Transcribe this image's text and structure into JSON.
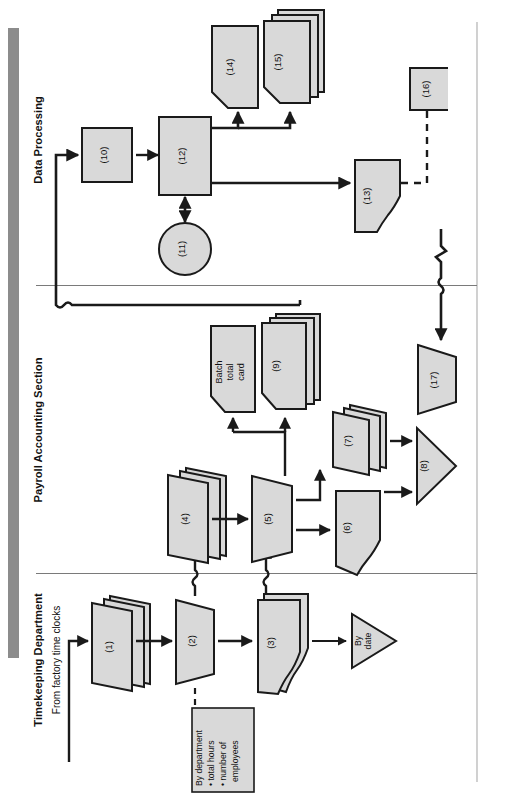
{
  "figure": {
    "orientation": "rotated-90-ccw",
    "type": "system-flowchart",
    "swimlanes": [
      {
        "id": "timekeeping",
        "label": "Timekeeping Department"
      },
      {
        "id": "payroll",
        "label": "Payroll Accounting Section"
      },
      {
        "id": "dataproc",
        "label": "Data Processing"
      }
    ],
    "entry_note": "From factory time clocks",
    "annotations": [
      {
        "id": "ann-batch",
        "text": "By department\n•  total hours\n•  number of\n    employees"
      }
    ],
    "file_labels": [
      {
        "id": "file-bydate",
        "text": "By\ndate"
      }
    ],
    "named_nodes": [
      {
        "id": "batch-total-card",
        "text": "Batch\ntotal\ncard"
      }
    ],
    "nodes": [
      {
        "id": "n1",
        "label": "(1)",
        "shape": "card-stack",
        "lane": "timekeeping"
      },
      {
        "id": "n2",
        "label": "(2)",
        "shape": "manual-operation",
        "lane": "timekeeping"
      },
      {
        "id": "n3",
        "label": "(3)",
        "shape": "document-stack",
        "lane": "timekeeping"
      },
      {
        "id": "n4",
        "label": "(4)",
        "shape": "card-stack",
        "lane": "payroll"
      },
      {
        "id": "n5",
        "label": "(5)",
        "shape": "manual-operation",
        "lane": "payroll"
      },
      {
        "id": "n6",
        "label": "(6)",
        "shape": "document",
        "lane": "payroll"
      },
      {
        "id": "n7",
        "label": "(7)",
        "shape": "card-stack",
        "lane": "payroll"
      },
      {
        "id": "n8",
        "label": "(8)",
        "shape": "file-triangle",
        "lane": "payroll"
      },
      {
        "id": "n9",
        "label": "(9)",
        "shape": "punched-card-stack",
        "lane": "payroll"
      },
      {
        "id": "n10",
        "label": "(10)",
        "shape": "process",
        "lane": "dataproc"
      },
      {
        "id": "n11",
        "label": "(11)",
        "shape": "magnetic-disk",
        "lane": "dataproc"
      },
      {
        "id": "n12",
        "label": "(12)",
        "shape": "process",
        "lane": "dataproc"
      },
      {
        "id": "n13",
        "label": "(13)",
        "shape": "document",
        "lane": "dataproc"
      },
      {
        "id": "n14",
        "label": "(14)",
        "shape": "punched-card",
        "lane": "dataproc"
      },
      {
        "id": "n15",
        "label": "(15)",
        "shape": "punched-card-stack",
        "lane": "dataproc"
      },
      {
        "id": "n16",
        "label": "(16)",
        "shape": "annotation-box",
        "lane": "dataproc"
      },
      {
        "id": "n17",
        "label": "(17)",
        "shape": "manual-operation",
        "lane": "payroll"
      }
    ],
    "colors": {
      "shape_fill": "#d9d9d9",
      "shape_stroke": "#1a1a1a",
      "flow_line": "#1a1a1a",
      "lane_divider": "#7a7a7a",
      "left_bar": "#8c8c8c",
      "page_border": "#bdbdbd",
      "text": "#111111"
    }
  }
}
